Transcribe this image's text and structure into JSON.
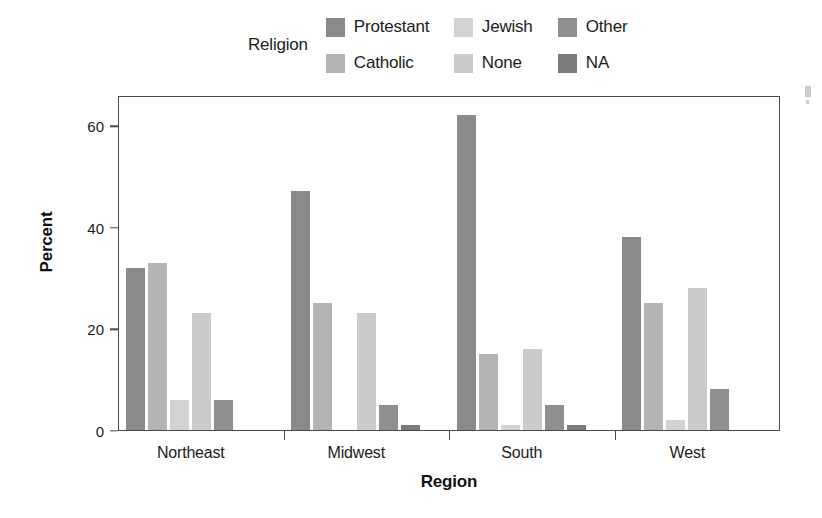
{
  "legend": {
    "title": "Religion",
    "entries": [
      {
        "label": "Protestant",
        "color": "#8a8a8a",
        "swatch_name": "legend-swatch-protestant"
      },
      {
        "label": "Jewish",
        "color": "#d2d2d2",
        "swatch_name": "legend-swatch-jewish"
      },
      {
        "label": "Other",
        "color": "#8f8f8f",
        "swatch_name": "legend-swatch-other"
      },
      {
        "label": "Catholic",
        "color": "#b4b4b4",
        "swatch_name": "legend-swatch-catholic"
      },
      {
        "label": "None",
        "color": "#cbcbcb",
        "swatch_name": "legend-swatch-none"
      },
      {
        "label": "NA",
        "color": "#7b7b7b",
        "swatch_name": "legend-swatch-na"
      }
    ]
  },
  "axes": {
    "ylabel": "Percent",
    "xlabel": "Region",
    "yticks": [
      0,
      20,
      40,
      60
    ],
    "ytick_labels": [
      "0",
      "20",
      "40",
      "60"
    ],
    "ylim": [
      0,
      66
    ],
    "xtick_labels": [
      "Northeast",
      "Midwest",
      "South",
      "West"
    ]
  },
  "chart_data": {
    "type": "bar",
    "title": "",
    "subtitle": "",
    "xlabel": "Region",
    "ylabel": "Percent",
    "ylim": [
      0,
      66
    ],
    "yticks": [
      0,
      20,
      40,
      60
    ],
    "grid": false,
    "legend_title": "Religion",
    "legend_position": "top",
    "categories": [
      "Northeast",
      "Midwest",
      "South",
      "West"
    ],
    "series": [
      {
        "name": "Protestant",
        "color": "#8a8a8a",
        "values": [
          32,
          47,
          62,
          38
        ]
      },
      {
        "name": "Catholic",
        "color": "#b4b4b4",
        "values": [
          33,
          25,
          15,
          25
        ]
      },
      {
        "name": "Jewish",
        "color": "#d2d2d2",
        "values": [
          6,
          0,
          1,
          2
        ]
      },
      {
        "name": "None",
        "color": "#cbcbcb",
        "values": [
          23,
          23,
          16,
          28
        ]
      },
      {
        "name": "Other",
        "color": "#8f8f8f",
        "values": [
          6,
          5,
          5,
          8
        ]
      },
      {
        "name": "NA",
        "color": "#7b7b7b",
        "values": [
          0,
          1,
          1,
          0
        ]
      }
    ]
  }
}
